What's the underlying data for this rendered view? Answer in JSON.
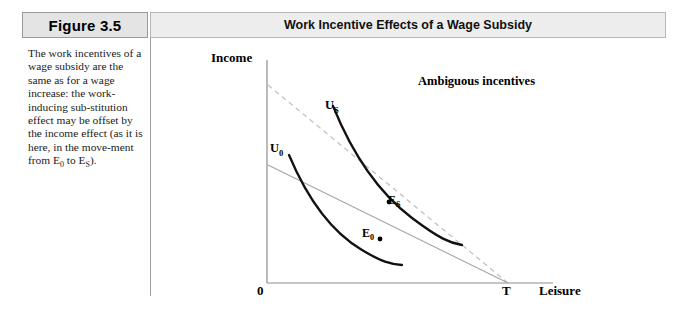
{
  "header": {
    "figure_tag": "Figure 3.5",
    "title": "Work Incentive Effects of a Wage Subsidy"
  },
  "caption": {
    "text": "The work incentives of a wage subsidy are the same as for a wage increase: the work-inducing substitution effect may be offset by the income effect (as it is here, in the movement from E0 to ES)."
  },
  "chart_data": {
    "type": "line",
    "title": "Work Incentive Effects of a Wage Subsidy",
    "xlabel": "Leisure",
    "ylabel": "Income",
    "grid": false,
    "legend": "none",
    "axis_labels": {
      "origin": "0",
      "x_axis": "Leisure",
      "y_axis": "Income",
      "time_endowment": "T"
    },
    "annotations": [
      {
        "name": "ambiguous-incentives",
        "text": "Ambiguous incentives"
      }
    ],
    "series": [
      {
        "name": "original budget constraint",
        "style": "solid-thin",
        "color": "#9a9a9a",
        "points": [
          [
            0,
            0.42
          ],
          [
            1.0,
            0.0
          ]
        ]
      },
      {
        "name": "subsidized budget constraint",
        "style": "dashed",
        "color": "#bdbdbd",
        "points": [
          [
            0,
            0.81
          ],
          [
            1.0,
            0.0
          ]
        ]
      },
      {
        "name": "U0",
        "label": "U0",
        "style": "solid-thick",
        "color": "#000000",
        "description": "lower indifference curve, convex to origin"
      },
      {
        "name": "US",
        "label": "US",
        "style": "solid-thick",
        "color": "#000000",
        "description": "higher indifference curve, convex to origin"
      }
    ],
    "points": [
      {
        "name": "E0",
        "label": "E0",
        "x": 0.47,
        "y": 0.23,
        "description": "tangency of U0 with original budget constraint"
      },
      {
        "name": "ES",
        "label": "ES",
        "x": 0.51,
        "y": 0.41,
        "description": "tangency of US with subsidized budget constraint"
      }
    ],
    "curve_labels": {
      "u0": "U",
      "u0_sub": "0",
      "us": "U",
      "us_sub": "S",
      "e0": "E",
      "e0_sub": "0",
      "es": "E",
      "es_sub": "S"
    }
  }
}
